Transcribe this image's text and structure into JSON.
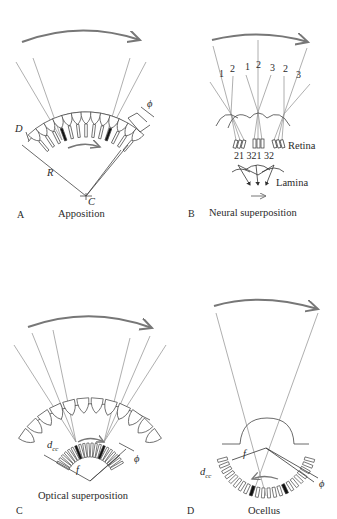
{
  "figure": {
    "panels": [
      {
        "id": "A",
        "letter": "A",
        "caption": "Apposition",
        "labels": {
          "diameter": "D",
          "radius": "R",
          "center": "C",
          "angle": "ϕ"
        }
      },
      {
        "id": "B",
        "letter": "B",
        "caption": "Neural superposition",
        "labels": {
          "top_numbers": [
            "1",
            "2",
            "1",
            "2",
            "3",
            "2",
            "3"
          ],
          "bottom_numbers": [
            "2",
            "1",
            "3",
            "2",
            "1",
            "3",
            "2"
          ],
          "retina": "Retina",
          "lamina": "Lamina"
        }
      },
      {
        "id": "C",
        "letter": "C",
        "caption": "Optical superposition",
        "labels": {
          "spacing": "d",
          "spacing_sub": "cc",
          "focal": "f",
          "angle": "ϕ"
        }
      },
      {
        "id": "D",
        "letter": "D",
        "caption": "Ocellus",
        "labels": {
          "spacing": "d",
          "spacing_sub": "cc",
          "focal": "f",
          "angle": "ϕ"
        }
      }
    ],
    "colors": {
      "line": "#8a8a8a",
      "ink": "#2a2a2a",
      "arrow": "#777777",
      "background": "#ffffff"
    }
  }
}
